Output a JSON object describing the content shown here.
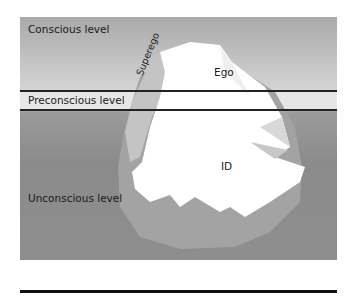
{
  "diagram": {
    "levels": {
      "conscious": "Conscious level",
      "preconscious": "Preconscious level",
      "unconscious": "Unconscious level"
    },
    "structures": {
      "ego": "Ego",
      "superego": "Superego",
      "id": "ID"
    },
    "colors": {
      "background_top": "#a9a9a9",
      "background_bottom": "#8b8b8b",
      "iceberg_light": "#ffffff",
      "iceberg_shadow": "#b0b0b0",
      "lines": "#222222"
    }
  }
}
